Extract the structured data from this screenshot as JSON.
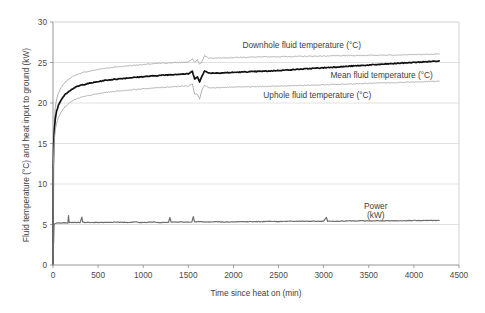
{
  "chart_data": {
    "type": "line",
    "title": "",
    "xlabel": "Time since heat on (min)",
    "ylabel": "Fluid temperature (°C) and heat input to ground (kW)",
    "xlim": [
      0,
      4500
    ],
    "ylim": [
      0,
      30
    ],
    "xticks": [
      0,
      500,
      1000,
      1500,
      2000,
      2500,
      3000,
      3500,
      4000,
      4500
    ],
    "yticks": [
      0,
      5,
      10,
      15,
      20,
      25,
      30
    ],
    "xtick_labels": [
      "0",
      "500",
      "1000",
      "1500",
      "2000",
      "2500",
      "3000",
      "3500",
      "4000",
      "4500"
    ],
    "ytick_labels": [
      "0",
      "5",
      "10",
      "15",
      "20",
      "25",
      "30"
    ],
    "grid": "horizontal",
    "legend": "inline-annotations",
    "annotations": [
      {
        "text": "Downhole fluid temperature (°C)",
        "x": 2760,
        "y": 27.2
      },
      {
        "text": "Mean fluid temperature (°C)",
        "x": 3640,
        "y": 23.5
      },
      {
        "text": "Uphole fluid temperature (°C)",
        "x": 2930,
        "y": 21.0
      },
      {
        "text": "Power",
        "x": 3580,
        "y": 7.3
      },
      {
        "text": "(kW)",
        "x": 3580,
        "y": 6.2
      }
    ],
    "series": [
      {
        "name": "Downhole fluid temperature (°C)",
        "color": "#a8a8a8",
        "width": 0.9,
        "x": [
          0,
          3,
          8,
          15,
          25,
          40,
          60,
          90,
          130,
          180,
          240,
          310,
          390,
          480,
          580,
          700,
          840,
          1000,
          1180,
          1380,
          1500,
          1545,
          1570,
          1600,
          1625,
          1650,
          1680,
          1720,
          1800,
          1950,
          2150,
          2400,
          2700,
          3000,
          3300,
          3600,
          3900,
          4150,
          4280
        ],
        "y": [
          0.2,
          12.6,
          16.0,
          17.9,
          19.4,
          20.5,
          21.2,
          21.9,
          22.5,
          23.0,
          23.4,
          23.7,
          23.9,
          24.1,
          24.3,
          24.45,
          24.6,
          24.75,
          24.9,
          25.0,
          25.05,
          25.45,
          25.0,
          25.35,
          24.75,
          25.1,
          25.9,
          25.55,
          25.55,
          25.6,
          25.65,
          25.7,
          25.75,
          25.8,
          25.85,
          25.9,
          25.95,
          26.0,
          26.05
        ]
      },
      {
        "name": "Mean fluid temperature (°C)",
        "color": "#111111",
        "width": 1.7,
        "x": [
          0,
          3,
          8,
          15,
          25,
          40,
          60,
          90,
          130,
          180,
          240,
          310,
          390,
          480,
          580,
          700,
          840,
          1000,
          1180,
          1380,
          1500,
          1545,
          1570,
          1600,
          1625,
          1650,
          1680,
          1720,
          1800,
          1950,
          2150,
          2400,
          2700,
          3000,
          3300,
          3600,
          3900,
          4150,
          4280
        ],
        "y": [
          0.2,
          12.1,
          15.0,
          16.7,
          18.0,
          19.0,
          19.7,
          20.4,
          21.0,
          21.5,
          21.9,
          22.2,
          22.4,
          22.6,
          22.8,
          22.95,
          23.1,
          23.25,
          23.4,
          23.55,
          23.6,
          23.9,
          23.0,
          23.2,
          22.6,
          23.3,
          24.0,
          23.7,
          23.7,
          23.75,
          23.85,
          23.95,
          24.15,
          24.35,
          24.55,
          24.75,
          24.95,
          25.1,
          25.2
        ]
      },
      {
        "name": "Uphole fluid temperature (°C)",
        "color": "#a8a8a8",
        "width": 0.9,
        "x": [
          0,
          3,
          8,
          15,
          25,
          40,
          60,
          90,
          130,
          180,
          240,
          310,
          390,
          480,
          580,
          700,
          840,
          1000,
          1180,
          1380,
          1500,
          1545,
          1570,
          1600,
          1625,
          1650,
          1680,
          1720,
          1800,
          1950,
          2150,
          2400,
          2700,
          3000,
          3300,
          3600,
          3900,
          4150,
          4280
        ],
        "y": [
          0.2,
          11.6,
          14.0,
          15.5,
          16.6,
          17.5,
          18.2,
          18.9,
          19.5,
          20.0,
          20.4,
          20.7,
          20.9,
          21.1,
          21.3,
          21.45,
          21.6,
          21.75,
          21.9,
          22.05,
          22.1,
          22.35,
          21.1,
          21.1,
          20.5,
          21.6,
          22.2,
          21.9,
          21.9,
          21.95,
          22.0,
          22.05,
          22.15,
          22.25,
          22.35,
          22.45,
          22.55,
          22.65,
          22.7
        ]
      },
      {
        "name": "Power (kW)",
        "color": "#6e6e6e",
        "width": 1.2,
        "x": [
          0,
          2,
          6,
          12,
          20,
          32,
          48,
          70,
          100,
          140,
          165,
          172,
          180,
          200,
          240,
          300,
          320,
          330,
          345,
          400,
          500,
          600,
          700,
          800,
          900,
          1000,
          1100,
          1200,
          1280,
          1295,
          1310,
          1400,
          1500,
          1540,
          1555,
          1570,
          1620,
          1700,
          1800,
          1900,
          2000,
          2100,
          2200,
          2300,
          2400,
          2500,
          2600,
          2700,
          2800,
          2900,
          3000,
          3030,
          3045,
          3060,
          3150,
          3250,
          3400,
          3550,
          3700,
          3850,
          4000,
          4150,
          4280
        ],
        "y": [
          0.0,
          2.6,
          2.6,
          5.0,
          5.1,
          5.15,
          5.2,
          5.2,
          5.2,
          5.2,
          5.2,
          6.1,
          5.25,
          5.25,
          5.25,
          5.25,
          5.9,
          5.3,
          5.25,
          5.25,
          5.25,
          5.25,
          5.3,
          5.25,
          5.3,
          5.25,
          5.3,
          5.25,
          5.25,
          5.85,
          5.3,
          5.3,
          5.3,
          5.3,
          6.0,
          5.3,
          5.35,
          5.3,
          5.35,
          5.3,
          5.35,
          5.35,
          5.35,
          5.35,
          5.4,
          5.35,
          5.4,
          5.4,
          5.4,
          5.4,
          5.4,
          5.9,
          5.4,
          5.4,
          5.4,
          5.45,
          5.45,
          5.45,
          5.45,
          5.45,
          5.5,
          5.5,
          5.5
        ]
      }
    ]
  }
}
